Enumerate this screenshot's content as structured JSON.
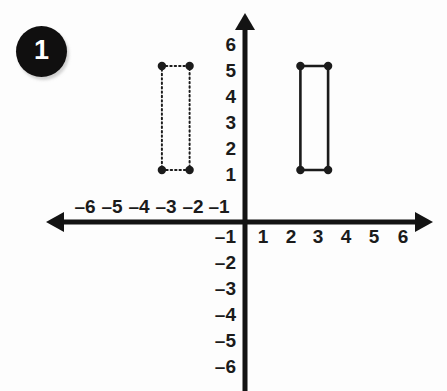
{
  "problem": {
    "badge_number": "1",
    "badge_bg_color": "#100f0f",
    "badge_text_color": "#ffffff"
  },
  "chart_data": {
    "type": "scatter",
    "title": "",
    "subtitle": "",
    "xlabel": "",
    "ylabel": "",
    "xlim": [
      -7,
      7
    ],
    "ylim": [
      -7,
      7
    ],
    "grid": false,
    "legend": null,
    "axis_color": "#131313",
    "shape_color": "#1b1b1b",
    "axes": {
      "x_ticks": [
        -6,
        -5,
        -4,
        -3,
        -2,
        -1,
        1,
        2,
        3,
        4,
        5,
        6
      ],
      "x_tick_labels": [
        "–6",
        "–5",
        "–4",
        "–3",
        "–2",
        "–1",
        "1",
        "2",
        "3",
        "4",
        "5",
        "6"
      ],
      "y_ticks": [
        6,
        5,
        4,
        3,
        2,
        1,
        -1,
        -2,
        -3,
        -4,
        -5,
        -6
      ],
      "y_tick_labels": [
        "6",
        "5",
        "4",
        "3",
        "2",
        "1",
        "–1",
        "–2",
        "–3",
        "–4",
        "–5",
        "–6"
      ],
      "x_arrow_left": true,
      "x_arrow_right": true,
      "y_arrow_top": true,
      "y_arrow_bottom": false
    },
    "series": [
      {
        "name": "preimage-rectangle",
        "style": "solid",
        "closed": true,
        "marker": "filled-circle",
        "points": [
          {
            "x": 2,
            "y": 2
          },
          {
            "x": 3,
            "y": 2
          },
          {
            "x": 3,
            "y": 6
          },
          {
            "x": 2,
            "y": 6
          }
        ]
      },
      {
        "name": "image-rectangle",
        "style": "dotted",
        "closed": true,
        "marker": "filled-circle",
        "points": [
          {
            "x": -3,
            "y": 2
          },
          {
            "x": -2,
            "y": 2
          },
          {
            "x": -2,
            "y": 6
          },
          {
            "x": -3,
            "y": 6
          }
        ]
      }
    ]
  }
}
